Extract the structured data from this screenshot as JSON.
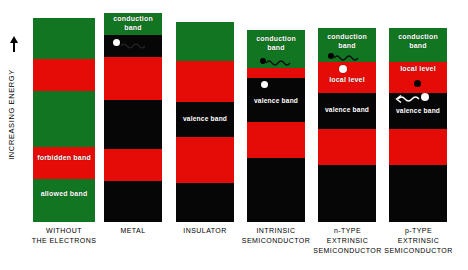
{
  "figure": {
    "axis_label": "INCREASING ENERGY",
    "axis_arrow_icon": "up-arrow-icon"
  },
  "colors": {
    "allowed_band": "#127521",
    "forbidden_band": "#e50b06",
    "filled_band": "#060606",
    "background": "#ffffff",
    "label_text": "#ffffff",
    "caption_text": "#000000"
  },
  "columns": [
    {
      "id": "without-the-electrons",
      "caption": "WITHOUT\nTHE ELECTRONS",
      "bands": [
        {
          "kind": "allowed",
          "label": ""
        },
        {
          "kind": "forbidden",
          "label": ""
        },
        {
          "kind": "allowed",
          "label": ""
        },
        {
          "kind": "forbidden",
          "label": "forbidden\nband"
        },
        {
          "kind": "allowed",
          "label": "allowed\nband"
        }
      ],
      "particles": []
    },
    {
      "id": "metal",
      "caption": "METAL",
      "bands": [
        {
          "kind": "allowed",
          "label": "conduction\nband"
        },
        {
          "kind": "filled",
          "label": ""
        },
        {
          "kind": "forbidden",
          "label": ""
        },
        {
          "kind": "filled",
          "label": ""
        },
        {
          "kind": "forbidden",
          "label": ""
        },
        {
          "kind": "filled",
          "label": ""
        }
      ],
      "particles": [
        {
          "type": "electron"
        },
        {
          "type": "squiggle"
        }
      ]
    },
    {
      "id": "insulator",
      "caption": "INSULATOR",
      "bands": [
        {
          "kind": "allowed",
          "label": ""
        },
        {
          "kind": "forbidden",
          "label": ""
        },
        {
          "kind": "filled",
          "label": "valence band"
        },
        {
          "kind": "forbidden",
          "label": ""
        },
        {
          "kind": "filled",
          "label": ""
        }
      ],
      "particles": []
    },
    {
      "id": "intrinsic-semiconductor",
      "caption": "INTRINSIC\nSEMICONDUCTOR",
      "bands": [
        {
          "kind": "allowed",
          "label": "conduction\nband"
        },
        {
          "kind": "forbidden",
          "label": ""
        },
        {
          "kind": "filled",
          "label": "valence band"
        },
        {
          "kind": "forbidden",
          "label": ""
        },
        {
          "kind": "filled",
          "label": ""
        }
      ],
      "particles": [
        {
          "type": "hole"
        },
        {
          "type": "squiggle"
        },
        {
          "type": "electron"
        }
      ]
    },
    {
      "id": "n-type-extrinsic-semiconductor",
      "caption": "n-TYPE\nEXTRINSIC\nSEMICONDUCTOR",
      "bands": [
        {
          "kind": "allowed",
          "label": "conduction\nband"
        },
        {
          "kind": "forbidden",
          "label": "local level"
        },
        {
          "kind": "filled",
          "label": "valence band"
        },
        {
          "kind": "forbidden",
          "label": ""
        },
        {
          "kind": "filled",
          "label": ""
        }
      ],
      "particles": [
        {
          "type": "hole"
        },
        {
          "type": "squiggle"
        },
        {
          "type": "electron"
        }
      ]
    },
    {
      "id": "p-type-extrinsic-semiconductor",
      "caption": "p-TYPE\nEXTRINSIC\nSEMICONDUCTOR",
      "bands": [
        {
          "kind": "allowed",
          "label": "conduction\nband"
        },
        {
          "kind": "forbidden",
          "label": "local level"
        },
        {
          "kind": "filled",
          "label": "valence band"
        },
        {
          "kind": "forbidden",
          "label": ""
        },
        {
          "kind": "filled",
          "label": ""
        }
      ],
      "particles": [
        {
          "type": "hole"
        },
        {
          "type": "squiggle"
        },
        {
          "type": "electron"
        }
      ]
    }
  ]
}
